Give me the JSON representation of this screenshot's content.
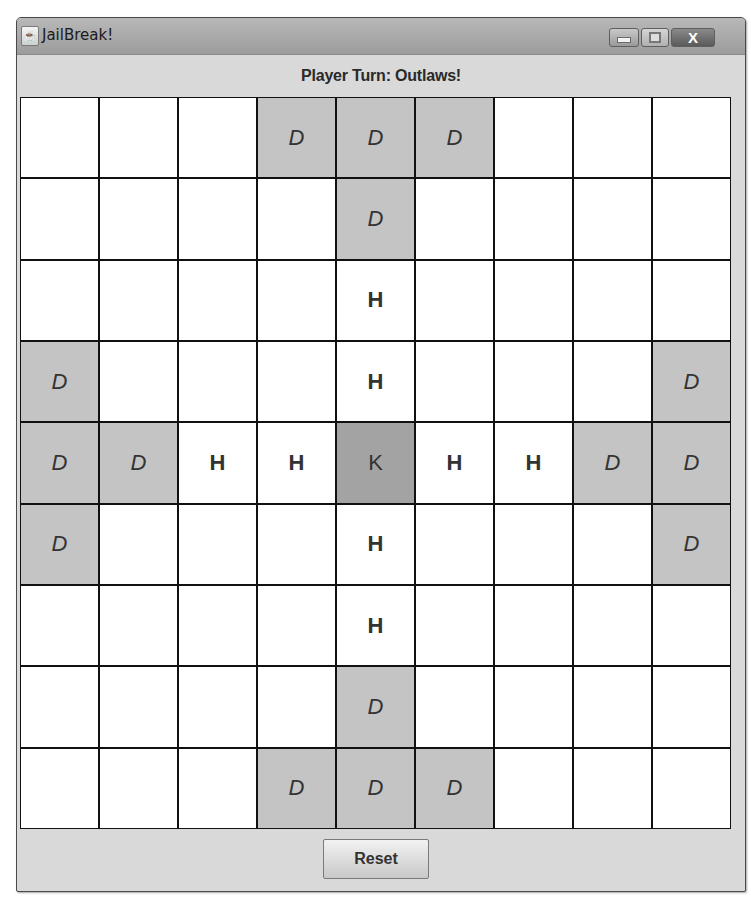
{
  "window": {
    "title": "JailBreak!",
    "icon": "java-cup-icon",
    "controls": {
      "minimize": "minimize-icon",
      "maximize": "maximize-icon",
      "close_label": "X"
    }
  },
  "status": {
    "text": "Player Turn: Outlaws!"
  },
  "board": {
    "rows": 9,
    "cols": 9,
    "legend": {
      "D": "defender",
      "H": "hostage",
      "K": "king",
      "": "empty"
    },
    "colors": {
      "empty": "#ffffff",
      "defender": "#c4c4c4",
      "king": "#a3a3a3",
      "grid_line": "#111111"
    },
    "cells": [
      [
        "",
        "",
        "",
        "D",
        "D",
        "D",
        "",
        "",
        ""
      ],
      [
        "",
        "",
        "",
        "",
        "D",
        "",
        "",
        "",
        ""
      ],
      [
        "",
        "",
        "",
        "",
        "H",
        "",
        "",
        "",
        ""
      ],
      [
        "D",
        "",
        "",
        "",
        "H",
        "",
        "",
        "",
        "D"
      ],
      [
        "D",
        "D",
        "H",
        "H",
        "K",
        "H",
        "H",
        "D",
        "D"
      ],
      [
        "D",
        "",
        "",
        "",
        "H",
        "",
        "",
        "",
        "D"
      ],
      [
        "",
        "",
        "",
        "",
        "H",
        "",
        "",
        "",
        ""
      ],
      [
        "",
        "",
        "",
        "",
        "D",
        "",
        "",
        "",
        ""
      ],
      [
        "",
        "",
        "",
        "D",
        "D",
        "D",
        "",
        "",
        ""
      ]
    ]
  },
  "footer": {
    "reset_label": "Reset"
  }
}
